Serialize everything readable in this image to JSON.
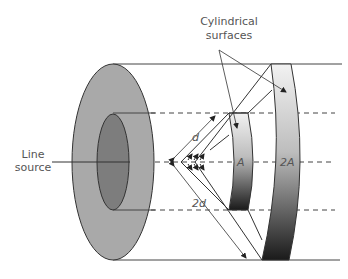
{
  "diagram": {
    "labels": {
      "cylindrical_line1": "Cylindrical",
      "cylindrical_line2": "surfaces",
      "source_line1": "Line",
      "source_line2": "source",
      "distance_near": "d",
      "distance_far": "2d",
      "area_near": "A",
      "area_far": "2A"
    },
    "colors": {
      "outer_ring": "#a9a9a9",
      "inner_core": "#7d7d7d",
      "stroke": "#333333",
      "band_top": "#eeeeee",
      "band_bottom": "#1e1e1e"
    }
  }
}
